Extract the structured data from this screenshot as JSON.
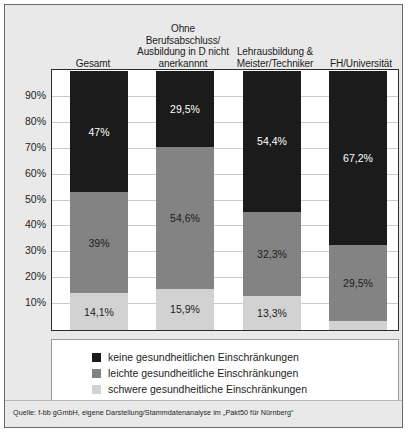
{
  "chart_data": {
    "type": "bar",
    "subtype": "stacked-bar-100",
    "title": "",
    "xlabel": "",
    "ylabel": "",
    "ylim": [
      0,
      100
    ],
    "grid": true,
    "legend_position": "bottom",
    "ytick_labels": [
      "90%",
      "80%",
      "70%",
      "60%",
      "50%",
      "40%",
      "30%",
      "20%",
      "10%"
    ],
    "ytick_values": [
      90,
      80,
      70,
      60,
      50,
      40,
      30,
      20,
      10
    ],
    "categories": [
      "Gesamt",
      "Ohne Berufsabschluss/ Ausbildung in D nicht anerkannnt",
      "Lehrausbildung & Meister/Techniker",
      "FH/Universität"
    ],
    "category_lines": [
      [
        "Gesamt"
      ],
      [
        "Ohne Berufsabschluss/",
        "Ausbildung in D nicht",
        "anerkannnt"
      ],
      [
        "Lehrausbildung &",
        "Meister/Techniker"
      ],
      [
        "FH/Universität"
      ]
    ],
    "series": [
      {
        "name": "keine gesundheitlichen Einschränkungen",
        "color": "#1b1b1b",
        "values": [
          47.0,
          29.5,
          54.4,
          67.2
        ],
        "labels": [
          "47%",
          "29,5%",
          "54,4%",
          "67,2%"
        ]
      },
      {
        "name": "leichte gesundheitliche Einschränkungen",
        "color": "#838383",
        "values": [
          39.0,
          54.6,
          32.3,
          29.5
        ],
        "labels": [
          "39%",
          "54,6%",
          "32,3%",
          "29,5%"
        ]
      },
      {
        "name": "schwere gesundheitliche Einschränkungen",
        "color": "#d2d2d2",
        "values": [
          14.1,
          15.9,
          13.3,
          3.3
        ],
        "labels": [
          "14,1%",
          "15,9%",
          "13,3%",
          ""
        ]
      }
    ]
  },
  "legend": {
    "items": [
      {
        "label": "keine gesundheitlichen Einschränkungen",
        "color": "#1b1b1b"
      },
      {
        "label": "leichte gesundheitliche Einschränkungen",
        "color": "#838383"
      },
      {
        "label": "schwere gesundheitliche Einschränkungen",
        "color": "#d2d2d2"
      }
    ]
  },
  "source": {
    "text": "Quelle: f-bb gGmbH, eigene Darstellung/Stammdatenanalyse im „Pakt50 für Nürnberg“"
  }
}
